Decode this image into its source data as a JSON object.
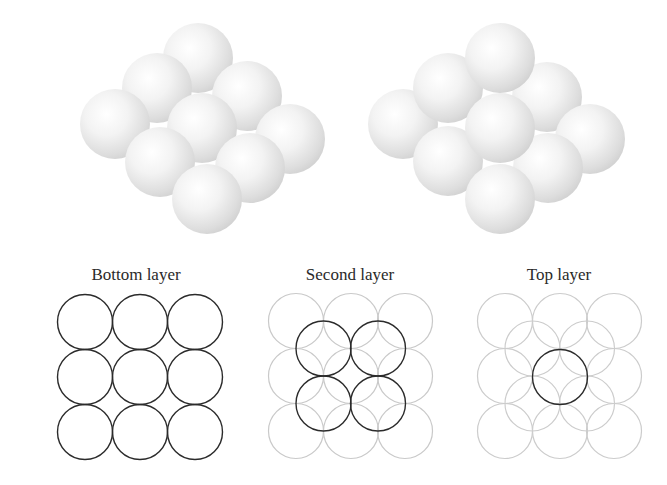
{
  "figure": {
    "illustrations": [
      {
        "name": "bottom-and-second-layer-stack",
        "description": "3x3 square layer of spheres"
      },
      {
        "name": "three-layer-pyramid-stack",
        "description": "3x3 bottom layer, 2x2 second layer, 1 top sphere"
      }
    ],
    "panels": [
      {
        "label": "Bottom layer",
        "dark_count": 9,
        "faded_count": 0
      },
      {
        "label": "Second layer",
        "dark_count": 4,
        "faded_count": 9
      },
      {
        "label": "Top layer",
        "dark_count": 1,
        "faded_count": 13
      }
    ],
    "colors": {
      "dark_outline": "#2b2b2b",
      "faded_outline": "#c9c9c9",
      "sphere_highlight": "#ffffff",
      "sphere_shadow": "#d4d4d4"
    }
  }
}
